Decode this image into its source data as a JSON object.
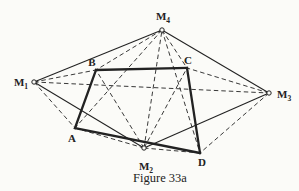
{
  "figure": {
    "caption": "Figure 33a",
    "paper_color": "#fbfbf8",
    "ink_color": "#222222",
    "canvas": {
      "width": 299,
      "height": 191
    },
    "points": [
      {
        "id": "M1",
        "x": 34,
        "y": 82,
        "marker": true,
        "label": "M",
        "sub": "1",
        "lx": 21,
        "ly": 86,
        "anchor": "middle"
      },
      {
        "id": "M2",
        "x": 144,
        "y": 148,
        "marker": true,
        "label": "M",
        "sub": "2",
        "lx": 146,
        "ly": 170,
        "anchor": "middle"
      },
      {
        "id": "M3",
        "x": 269,
        "y": 93,
        "marker": true,
        "label": "M",
        "sub": "3",
        "lx": 277,
        "ly": 98,
        "anchor": "start"
      },
      {
        "id": "M4",
        "x": 162,
        "y": 30,
        "marker": true,
        "label": "M",
        "sub": "4",
        "lx": 163,
        "ly": 20,
        "anchor": "middle"
      },
      {
        "id": "A",
        "x": 75,
        "y": 128,
        "marker": false,
        "label": "A",
        "sub": "",
        "lx": 72,
        "ly": 142,
        "anchor": "middle"
      },
      {
        "id": "B",
        "x": 96,
        "y": 70,
        "marker": false,
        "label": "B",
        "sub": "",
        "lx": 92,
        "ly": 66,
        "anchor": "middle"
      },
      {
        "id": "C",
        "x": 187,
        "y": 68,
        "marker": false,
        "label": "C",
        "sub": "",
        "lx": 188,
        "ly": 64,
        "anchor": "middle"
      },
      {
        "id": "D",
        "x": 200,
        "y": 153,
        "marker": false,
        "label": "D",
        "sub": "",
        "lx": 202,
        "ly": 166,
        "anchor": "middle"
      }
    ],
    "edges": {
      "quadrilateral_bold": [
        [
          "A",
          "B"
        ],
        [
          "B",
          "C"
        ],
        [
          "C",
          "D"
        ],
        [
          "D",
          "A"
        ]
      ],
      "m_quadrilateral_solid": [
        [
          "M1",
          "M4"
        ],
        [
          "M4",
          "M3"
        ],
        [
          "M3",
          "M2"
        ],
        [
          "M2",
          "M1"
        ]
      ],
      "dashed": [
        [
          "M1",
          "A"
        ],
        [
          "M1",
          "B"
        ],
        [
          "M4",
          "B"
        ],
        [
          "M4",
          "C"
        ],
        [
          "M3",
          "C"
        ],
        [
          "M3",
          "D"
        ],
        [
          "M2",
          "A"
        ],
        [
          "M2",
          "D"
        ],
        [
          "M1",
          "M3"
        ],
        [
          "M2",
          "M4"
        ],
        [
          "M4",
          "A"
        ],
        [
          "M4",
          "D"
        ],
        [
          "M2",
          "B"
        ],
        [
          "M2",
          "C"
        ]
      ]
    },
    "style": {
      "bold_width": 2.3,
      "solid_width": 1.05,
      "dashed_width": 0.9,
      "dash_pattern": "4.5,3",
      "marker_radius": 2.2
    }
  }
}
